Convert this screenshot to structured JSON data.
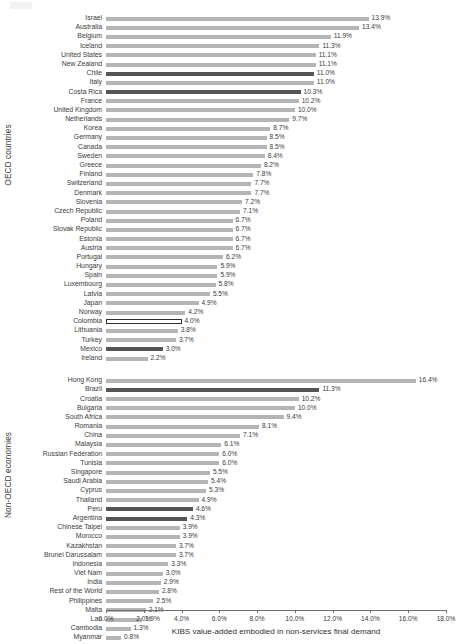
{
  "axes": {
    "y_group_oecd": "OECD countries",
    "y_group_nonoecd": "Non-OECD economies",
    "x_title": "KIBS value-added embodied in non-services final demand",
    "x_ticks": [
      "0.0%",
      "2.0%",
      "4.0%",
      "6.0%",
      "8.0%",
      "10.0%",
      "12.0%",
      "14.0%",
      "16.0%",
      "18.0%"
    ]
  },
  "colors": {
    "bar_default": "#b5b5b5",
    "bar_highlight": "#555555",
    "bar_outline": "#2e2e2e",
    "text": "#3b3b3b",
    "axis": "#6e6e6e"
  },
  "chart_data": {
    "type": "bar",
    "orientation": "horizontal",
    "title": "",
    "xlabel": "KIBS value-added embodied in non-services final demand",
    "ylabel": "",
    "xlim": [
      0,
      18
    ],
    "xtick_values": [
      0,
      2,
      4,
      6,
      8,
      10,
      12,
      14,
      16,
      18
    ],
    "grid": false,
    "legend": false,
    "value_suffix": "%",
    "groups": [
      {
        "name": "OECD countries",
        "categories": [
          "Israel",
          "Australia",
          "Belgium",
          "Iceland",
          "United States",
          "New Zealand",
          "Chile",
          "Italy",
          "Costa Rica",
          "France",
          "United Kingdom",
          "Netherlands",
          "Korea",
          "Germany",
          "Canada",
          "Sweden",
          "Greece",
          "Finland",
          "Switzerland",
          "Denmark",
          "Slovenia",
          "Czech Republic",
          "Poland",
          "Slovak Republic",
          "Estonia",
          "Austria",
          "Portugal",
          "Hungary",
          "Spain",
          "Luxembourg",
          "Latvia",
          "Japan",
          "Norway",
          "Colombia",
          "Lithuania",
          "Turkey",
          "Mexico",
          "Ireland"
        ],
        "values": [
          13.9,
          13.4,
          11.9,
          11.3,
          11.1,
          11.1,
          11.0,
          11.0,
          10.3,
          10.2,
          10.0,
          9.7,
          8.7,
          8.5,
          8.5,
          8.4,
          8.2,
          7.8,
          7.7,
          7.7,
          7.2,
          7.1,
          6.7,
          6.7,
          6.7,
          6.7,
          6.2,
          5.9,
          5.9,
          5.8,
          5.5,
          4.9,
          4.2,
          4.0,
          3.8,
          3.7,
          3.0,
          2.2
        ],
        "labels": [
          "13.9%",
          "13.4%",
          "11.9%",
          "11.3%",
          "11.1%",
          "11.1%",
          "11.0%",
          "11.0%",
          "10.3%",
          "10.2%",
          "10.0%",
          "9.7%",
          "8.7%",
          "8.5%",
          "8.5%",
          "8.4%",
          "8.2%",
          "7.8%",
          "7.7%",
          "7.7%",
          "7.2%",
          "7.1%",
          "6.7%",
          "6.7%",
          "6.7%",
          "6.7%",
          "6.2%",
          "5.9%",
          "5.9%",
          "5.8%",
          "5.5%",
          "4.9%",
          "4.2%",
          "4.0%",
          "3.8%",
          "3.7%",
          "3.0%",
          "2.2%"
        ],
        "styles": [
          "default",
          "default",
          "default",
          "default",
          "default",
          "default",
          "highlight",
          "default",
          "highlight",
          "default",
          "default",
          "default",
          "default",
          "default",
          "default",
          "default",
          "default",
          "default",
          "default",
          "default",
          "default",
          "default",
          "default",
          "default",
          "default",
          "default",
          "default",
          "default",
          "default",
          "default",
          "default",
          "default",
          "default",
          "outline",
          "default",
          "default",
          "highlight",
          "default"
        ]
      },
      {
        "name": "Non-OECD economies",
        "categories": [
          "Hong Kong",
          "Brazil",
          "Croatia",
          "Bulgaria",
          "South Africa",
          "Romania",
          "China",
          "Malaysia",
          "Russian Federation",
          "Tunisia",
          "Singapore",
          "Saudi Arabia",
          "Cyprus",
          "Thailand",
          "Peru",
          "Argentina",
          "Chinese Taipei",
          "Morocco",
          "Kazakhstan",
          "Brunei Darussalam",
          "Indonesia",
          "Viet Nam",
          "India",
          "Rest of the World",
          "Philippines",
          "Malta",
          "Lao",
          "Cambodia",
          "Myanmar"
        ],
        "values": [
          16.4,
          11.3,
          10.2,
          10.0,
          9.4,
          8.1,
          7.1,
          6.1,
          6.0,
          6.0,
          5.5,
          5.4,
          5.3,
          4.9,
          4.6,
          4.3,
          3.9,
          3.9,
          3.7,
          3.7,
          3.3,
          3.0,
          2.9,
          2.8,
          2.5,
          2.1,
          1.9,
          1.3,
          0.8
        ],
        "labels": [
          "16.4%",
          "11.3%",
          "10.2%",
          "10.0%",
          "9.4%",
          "8.1%",
          "7.1%",
          "6.1%",
          "6.0%",
          "6.0%",
          "5.5%",
          "5.4%",
          "5.3%",
          "4.9%",
          "4.6%",
          "4.3%",
          "3.9%",
          "3.9%",
          "3.7%",
          "3.7%",
          "3.3%",
          "3.0%",
          "2.9%",
          "2.8%",
          "2.5%",
          "2.1%",
          "1.9%",
          "1.3%",
          "0.8%"
        ],
        "styles": [
          "default",
          "highlight",
          "default",
          "default",
          "default",
          "default",
          "default",
          "default",
          "default",
          "default",
          "default",
          "default",
          "default",
          "default",
          "highlight",
          "highlight",
          "default",
          "default",
          "default",
          "default",
          "default",
          "default",
          "default",
          "default",
          "default",
          "default",
          "default",
          "default",
          "default"
        ]
      }
    ]
  }
}
